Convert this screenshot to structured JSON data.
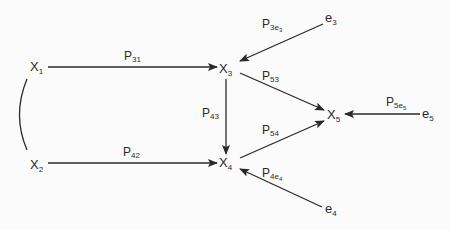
{
  "diagram": {
    "type": "path-diagram",
    "nodes": [
      {
        "id": "X1",
        "base": "X",
        "sub": "1",
        "x": 30,
        "y": 71
      },
      {
        "id": "X2",
        "base": "X",
        "sub": "2",
        "x": 30,
        "y": 169
      },
      {
        "id": "X3",
        "base": "X",
        "sub": "3",
        "x": 220,
        "y": 73
      },
      {
        "id": "X4",
        "base": "X",
        "sub": "4",
        "x": 220,
        "y": 167
      },
      {
        "id": "X5",
        "base": "X",
        "sub": "5",
        "x": 327,
        "y": 119
      },
      {
        "id": "e3",
        "base": "e",
        "sub": "3",
        "x": 325,
        "y": 23
      },
      {
        "id": "e4",
        "base": "e",
        "sub": "4",
        "x": 325,
        "y": 214
      },
      {
        "id": "e5",
        "base": "e",
        "sub": "5",
        "x": 422,
        "y": 119
      }
    ],
    "edges": [
      {
        "from": "X1",
        "to": "X3",
        "label": {
          "base": "P",
          "sub": "31"
        }
      },
      {
        "from": "X2",
        "to": "X4",
        "label": {
          "base": "P",
          "sub": "42"
        }
      },
      {
        "from": "X3",
        "to": "X4",
        "label": {
          "base": "P",
          "sub": "43"
        }
      },
      {
        "from": "X3",
        "to": "X5",
        "label": {
          "base": "P",
          "sub": "53"
        }
      },
      {
        "from": "X4",
        "to": "X5",
        "label": {
          "base": "P",
          "sub": "54"
        }
      },
      {
        "from": "e3",
        "to": "X3",
        "label": {
          "base": "P",
          "sub": "3e",
          "sub2": "3"
        }
      },
      {
        "from": "e4",
        "to": "X4",
        "label": {
          "base": "P",
          "sub": "4e",
          "sub2": "4"
        }
      },
      {
        "from": "e5",
        "to": "X5",
        "label": {
          "base": "P",
          "sub": "5e",
          "sub2": "5"
        }
      }
    ],
    "correlations": [
      {
        "between": [
          "X1",
          "X2"
        ],
        "style": "curved-line"
      }
    ]
  },
  "labels": {
    "x1": {
      "base": "X",
      "sub": "1"
    },
    "x2": {
      "base": "X",
      "sub": "2"
    },
    "x3": {
      "base": "X",
      "sub": "3"
    },
    "x4": {
      "base": "X",
      "sub": "4"
    },
    "x5": {
      "base": "X",
      "sub": "5"
    },
    "e3": {
      "base": "e",
      "sub": "3"
    },
    "e4": {
      "base": "e",
      "sub": "4"
    },
    "e5": {
      "base": "e",
      "sub": "5"
    },
    "p31": {
      "base": "P",
      "sub": "31"
    },
    "p42": {
      "base": "P",
      "sub": "42"
    },
    "p43": {
      "base": "P",
      "sub": "43"
    },
    "p53": {
      "base": "P",
      "sub": "53"
    },
    "p54": {
      "base": "P",
      "sub": "54"
    },
    "p3e3": {
      "base": "P",
      "sub": "3e",
      "sub2": "3"
    },
    "p4e4": {
      "base": "P",
      "sub": "4e",
      "sub2": "4"
    },
    "p5e5": {
      "base": "P",
      "sub": "5e",
      "sub2": "5"
    }
  },
  "colors": {
    "ink": "#2a2a2a",
    "background": "#fbfbfb"
  }
}
